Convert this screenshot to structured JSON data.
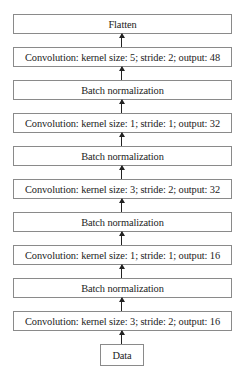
{
  "diagram": {
    "type": "flowchart",
    "direction": "bottom-to-top",
    "layers": [
      {
        "label": "Flatten"
      },
      {
        "label": "Convolution: kernel size: 5; stride: 2; output: 48"
      },
      {
        "label": "Batch normalization"
      },
      {
        "label": "Convolution: kernel size: 1; stride: 1; output: 32"
      },
      {
        "label": "Batch normalization"
      },
      {
        "label": "Convolution: kernel size: 3; stride: 2; output: 32"
      },
      {
        "label": "Batch normalization"
      },
      {
        "label": "Convolution: kernel size: 1; stride: 1; output: 16"
      },
      {
        "label": "Batch normalization"
      },
      {
        "label": "Convolution: kernel size: 3; stride: 2; output: 16"
      }
    ],
    "input": {
      "label": "Data"
    }
  }
}
